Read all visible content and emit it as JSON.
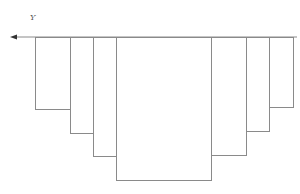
{
  "title_fragment": "",
  "axis": {
    "label": "Y",
    "direction": "left-arrow",
    "y": 37,
    "x_start": 10,
    "x_end": 297,
    "color": "#8a8a8a"
  },
  "bars": [
    {
      "x0": 35,
      "x1": 70,
      "bottom": 109
    },
    {
      "x0": 70,
      "x1": 93,
      "bottom": 133
    },
    {
      "x0": 93,
      "x1": 116,
      "bottom": 156
    },
    {
      "x0": 116,
      "x1": 211,
      "bottom": 180
    },
    {
      "x0": 211,
      "x1": 246,
      "bottom": 155
    },
    {
      "x0": 246,
      "x1": 269,
      "bottom": 131
    },
    {
      "x0": 269,
      "x1": 293,
      "bottom": 107
    }
  ],
  "line_color": "#8a8a8a"
}
